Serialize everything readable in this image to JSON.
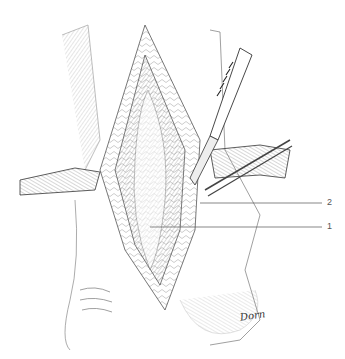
{
  "figure": {
    "labels": [
      {
        "id": "2",
        "text": "2"
      },
      {
        "id": "1",
        "text": "1"
      }
    ],
    "signature": "Dorn"
  }
}
